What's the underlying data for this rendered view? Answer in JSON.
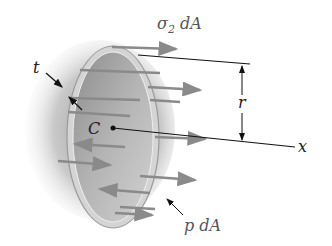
{
  "diagram": {
    "type": "mechanics-free-body",
    "labels": {
      "stress": "σ₂ dA",
      "stress_sigma": "σ",
      "stress_sub": "2",
      "stress_tail": " dA",
      "thickness": "t",
      "radius": "r",
      "center": "C",
      "axis": "x",
      "pressure": "p dA"
    },
    "colors": {
      "arrow": "#8a8a8a",
      "line": "#111111",
      "shell_rim": "#c8c8c8",
      "shell_inside": "#a9a9a9"
    }
  }
}
